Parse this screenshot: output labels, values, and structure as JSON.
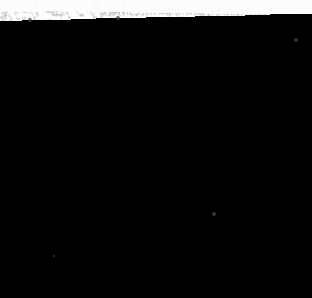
{
  "image": {
    "kind": "natural-image",
    "subject": "inverted-triangle-granular-specimen",
    "description": "Dark coarse granular triangular specimen photographed on a plain white background",
    "width": 312,
    "height": 298,
    "background_color": "#fdfdfd",
    "alt_text": "Dark grainy downward-pointing triangle on white background"
  },
  "shape": {
    "type": "triangle",
    "orientation": "point-down",
    "vertices": [
      {
        "name": "top-left",
        "x": 6,
        "y": 24
      },
      {
        "name": "top-right",
        "x": 300,
        "y": 28
      },
      {
        "name": "bottom-apex",
        "x": 150,
        "y": 295
      }
    ],
    "edge_quality": "ragged-granular",
    "edge_fringe_px": 6
  },
  "texture": {
    "style": "coarse-granular-speckle",
    "base_color": "#1a1a1a",
    "deep_shadow_color": "#000000",
    "mid_tone_color": "#3c3c3c",
    "highlight_color": "#b4b4b4",
    "grain_size_px": 3,
    "grain_count": 14000,
    "light_direction": "upper-left",
    "shadow_patches": [
      {
        "cx": 155,
        "cy": 62,
        "rx": 52,
        "ry": 20
      },
      {
        "cx": 128,
        "cy": 112,
        "rx": 44,
        "ry": 26
      },
      {
        "cx": 215,
        "cy": 95,
        "rx": 38,
        "ry": 30
      },
      {
        "cx": 60,
        "cy": 70,
        "rx": 28,
        "ry": 22
      },
      {
        "cx": 140,
        "cy": 190,
        "rx": 34,
        "ry": 22
      },
      {
        "cx": 185,
        "cy": 150,
        "rx": 26,
        "ry": 20
      },
      {
        "cx": 250,
        "cy": 55,
        "rx": 30,
        "ry": 18
      }
    ],
    "bright_patches": [
      {
        "cx": 95,
        "cy": 160,
        "rx": 40,
        "ry": 30
      },
      {
        "cx": 175,
        "cy": 225,
        "rx": 42,
        "ry": 32
      },
      {
        "cx": 245,
        "cy": 105,
        "rx": 24,
        "ry": 20
      },
      {
        "cx": 40,
        "cy": 45,
        "rx": 26,
        "ry": 16
      },
      {
        "cx": 120,
        "cy": 240,
        "rx": 26,
        "ry": 24
      }
    ]
  },
  "specks": [
    {
      "name": "stray-speck-upper-left",
      "x": 30,
      "y": 20,
      "r": 2
    },
    {
      "name": "stray-speck-upper-mid",
      "x": 118,
      "y": 18,
      "r": 2
    },
    {
      "name": "stray-speck-right",
      "x": 296,
      "y": 40,
      "r": 2
    },
    {
      "name": "stray-speck-lower-right",
      "x": 214,
      "y": 214,
      "r": 2
    },
    {
      "name": "stray-speck-lower-left",
      "x": 54,
      "y": 256,
      "r": 1
    }
  ],
  "render": {
    "seed": 20240517
  }
}
